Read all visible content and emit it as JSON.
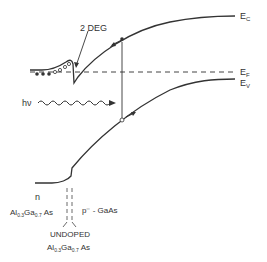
{
  "diagram": {
    "type": "band-diagram",
    "colors": {
      "ink": "#333333",
      "background": "#ffffff"
    },
    "labels": {
      "two_deg": "2 DEG",
      "ec": "E",
      "ec_sub": "C",
      "ef": "E",
      "ef_sub": "F",
      "ev": "E",
      "ev_sub": "V",
      "photon_h": "h",
      "photon_nu": "ν",
      "n_region": "n",
      "n_material_al": "Al",
      "n_material_x": "0.3",
      "n_material_ga": "Ga",
      "n_material_y": "0.7",
      "n_material_as": "As",
      "p_region": "p⁻ - GaAs",
      "undoped": "UNDOPED",
      "undoped_material_al": "Al",
      "undoped_material_x": "0.3",
      "undoped_material_ga": "Ga",
      "undoped_material_y": "0.7",
      "undoped_material_as": "As"
    },
    "carriers": {
      "electron_symbol": "•",
      "hole_symbol": "○",
      "electrons_in_well": 3,
      "ionized_donors": 4
    }
  }
}
